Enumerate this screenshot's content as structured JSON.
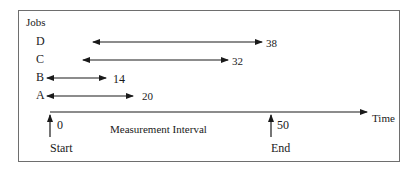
{
  "diagram": {
    "y_axis_title": "Jobs",
    "x_axis_label": "Time",
    "interval_label": "Measurement  Interval",
    "markers": {
      "start": {
        "label": "Start",
        "value": "0"
      },
      "end": {
        "label": "End",
        "value": "50"
      }
    },
    "jobs": [
      {
        "name": "D",
        "end_value": "38"
      },
      {
        "name": "C",
        "end_value": "32"
      },
      {
        "name": "B",
        "end_value": "14"
      },
      {
        "name": "A",
        "end_value": "20"
      }
    ],
    "colors": {
      "line": "#1a1a1a",
      "frame": "#6e6e6e",
      "background": "#ffffff"
    }
  }
}
